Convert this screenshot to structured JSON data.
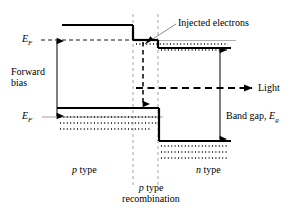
{
  "figure": {
    "type": "band-diagram",
    "colors": {
      "band_line": "#000000",
      "fermi_dash": "#000000",
      "junction_guide": "#9a9a9a",
      "carrier_dots": "#000000",
      "background": "#ffffff"
    }
  },
  "labels": {
    "fermi_top": "E",
    "fermi_top_sub": "F",
    "fermi_bottom": "E",
    "fermi_bottom_sub": "F",
    "forward_bias_line1": "Forward",
    "forward_bias_line2": "bias",
    "injected_electrons": "Injected electrons",
    "light": "Light",
    "band_gap": "Band gap, ",
    "band_gap_symbol": "E",
    "band_gap_sub": "g",
    "p_type": "p",
    "p_type_word": " type",
    "n_type": "n",
    "n_type_word": " type",
    "recombination_line1_italic": "p",
    "recombination_line1_rest": " type",
    "recombination_line2": "recombination"
  },
  "geometry": {
    "conduction_band": {
      "p_level_y": 25,
      "step1_y": 40,
      "step2_y": 48,
      "p_left_x": 62,
      "junction_x1": 133,
      "junction_x2": 158,
      "n_right_x": 231
    },
    "valence_band": {
      "p_level_y": 108,
      "n_level_y": 141,
      "p_left_x": 57,
      "junction_x": 159,
      "n_right_x": 231
    },
    "fermi_levels": {
      "p_fermi_y": 40,
      "n_fermi_y": 117
    },
    "junction_guides_x": [
      133,
      158
    ],
    "band_gap_arrow_x": 220,
    "forward_bias_arrow_x": 57,
    "recombination_arrow_x": 143,
    "light_arrow_y": 88
  },
  "carrier_dot_rows": {
    "n_conduction": [
      44,
      50
    ],
    "p_valence": [
      117,
      123,
      129
    ],
    "n_valence": [
      146,
      152,
      158
    ]
  }
}
